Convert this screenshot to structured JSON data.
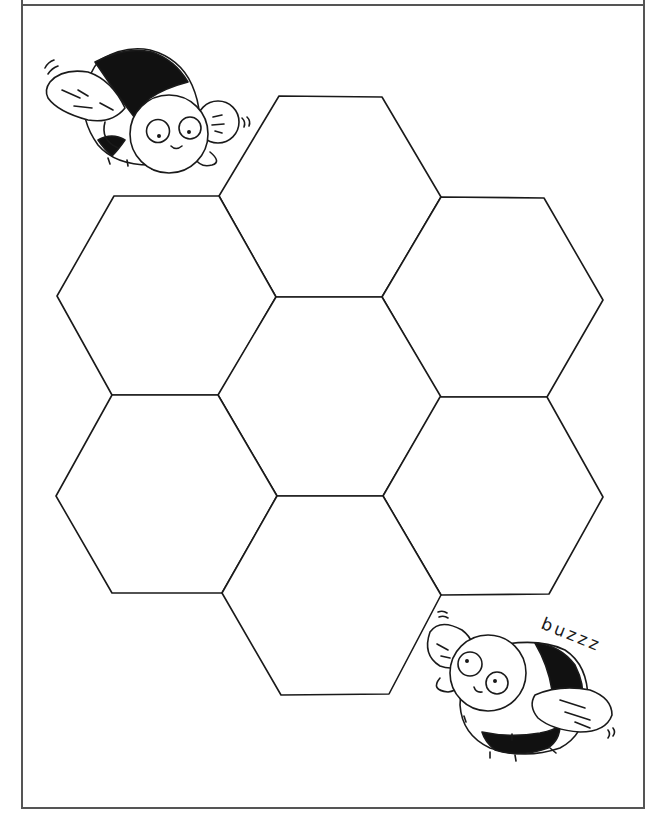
{
  "page": {
    "type": "coloring-worksheet",
    "frame": {
      "left": 22,
      "right": 644,
      "top": 5,
      "bottom": 808,
      "color": "#555555"
    },
    "stroke_color": "#1a1a1a",
    "fill_color": "#ffffff"
  },
  "honeycomb": {
    "cell_count": 7,
    "cells": [
      {
        "name": "top",
        "points": "279,96 382,97 441,197 382,297 276,297 219,196"
      },
      {
        "name": "upper-left",
        "points": "114,196 219,196 276,297 219,395 112,395 57,296"
      },
      {
        "name": "upper-right",
        "points": "441,197 544,198 603,300 547,397 440,397 382,297"
      },
      {
        "name": "center",
        "points": "276,297 382,297 441,397 383,496 277,496 218,395"
      },
      {
        "name": "lower-left",
        "points": "112,395 218,395 277,496 222,593 112,593 56,496"
      },
      {
        "name": "lower-right",
        "points": "440,397 547,397 603,497 549,594 441,595 383,496"
      },
      {
        "name": "bottom",
        "points": "277,496 383,496 441,595 389,694 281,695 222,593"
      }
    ]
  },
  "bees": [
    {
      "name": "top-left-bee",
      "position": "top-left"
    },
    {
      "name": "bottom-right-bee",
      "position": "bottom-right"
    }
  ],
  "caption": {
    "buzz_text": "buzzz"
  }
}
